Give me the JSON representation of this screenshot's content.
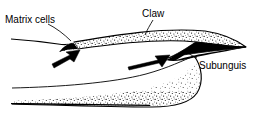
{
  "figure": {
    "kind": "anatomical-line-diagram",
    "background_color": "#ffffff",
    "ink_color": "#000000"
  },
  "labels": {
    "matrix_cells": "Matrix cells",
    "claw": "Claw",
    "subunguis": "Subunguis"
  },
  "icons": {
    "arrow_growth_proximal": "arrow-icon",
    "arrow_growth_distal": "arrow-icon"
  },
  "annotations": {
    "leader_lines": 3,
    "arrows": 2,
    "arrow_meaning": "direction of claw growth"
  },
  "structures": {
    "unguis": "stippled dorsal claw plate",
    "subunguis": "solid black ventral wedge",
    "digit_tip": "stippled dermal pad beneath claw",
    "epidermis": "line entering from left margin with matrix notch"
  }
}
